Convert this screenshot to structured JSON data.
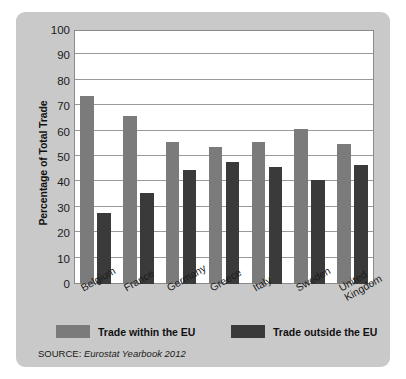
{
  "chart_data": {
    "type": "bar",
    "title": "",
    "xlabel": "",
    "ylabel": "Percentage of Total Trade",
    "ylim": [
      0,
      100
    ],
    "yticks": [
      0,
      10,
      20,
      30,
      40,
      50,
      60,
      70,
      80,
      90,
      100
    ],
    "grid": true,
    "legend_position": "bottom",
    "categories": [
      "Belgium",
      "France",
      "Germany",
      "Greece",
      "Italy",
      "Sweden",
      "United\nKingdom"
    ],
    "series": [
      {
        "name": "Trade within the EU",
        "color": "#7b7b7b",
        "values": [
          74,
          66,
          56,
          54,
          56,
          61,
          55
        ]
      },
      {
        "name": "Trade outside the EU",
        "color": "#3a3a3a",
        "values": [
          28,
          36,
          45,
          48,
          46,
          41,
          47
        ]
      }
    ],
    "source_label": "SOURCE:",
    "source_value": "Eurostat Yearbook 2012"
  },
  "colors": {
    "panel_background": "#c9c9c9",
    "plot_background": "#ffffff",
    "gridline": "#9a9a9a",
    "axis": "#8a8a8a",
    "text": "#1a1a1a",
    "series_within": "#7b7b7b",
    "series_outside": "#3a3a3a"
  }
}
